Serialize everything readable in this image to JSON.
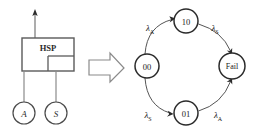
{
  "figure": {
    "left_diagram": {
      "block": {
        "label": "HSP",
        "x": 22,
        "y": 38,
        "width": 52,
        "height": 33,
        "inner_divider_x": 48,
        "inner_divider_y": 56
      },
      "output_arrow": {
        "name": "upward-output-arrow",
        "from_x": 35,
        "from_y": 38,
        "to_x": 35,
        "to_y": 12
      },
      "components": [
        {
          "label": "A",
          "cx": 24,
          "cy": 113,
          "r": 11,
          "stem_from_y": 71
        },
        {
          "label": "S",
          "cx": 56,
          "cy": 113,
          "r": 11,
          "stem_from_y": 71
        }
      ]
    },
    "transform_arrow": {
      "name": "block-arrow-right",
      "label": "",
      "x": 88,
      "y": 58,
      "width": 36,
      "height": 20
    },
    "markov_diagram": {
      "states": [
        {
          "id": "s00",
          "label": "00",
          "cx": 147,
          "cy": 66,
          "r": 12
        },
        {
          "id": "s10",
          "label": "10",
          "cx": 186,
          "cy": 21,
          "r": 12
        },
        {
          "id": "s01",
          "label": "01",
          "cx": 186,
          "cy": 113,
          "r": 12
        },
        {
          "id": "sfail",
          "label": "Fail",
          "cx": 232,
          "cy": 66,
          "r": 13
        }
      ],
      "transitions": [
        {
          "from": "s00",
          "to": "s10",
          "rate": "λ",
          "subscript": "A",
          "label_x": 151,
          "label_y": 28,
          "name": "transition-00-to-10"
        },
        {
          "from": "s10",
          "to": "sfail",
          "rate": "λ",
          "subscript": "S",
          "label_x": 215,
          "label_y": 28,
          "name": "transition-10-to-fail"
        },
        {
          "from": "s00",
          "to": "s01",
          "rate": "λ",
          "subscript": "S",
          "label_x": 148,
          "label_y": 115,
          "name": "transition-00-to-01"
        },
        {
          "from": "s01",
          "to": "sfail",
          "rate": "λ",
          "subscript": "A",
          "label_x": 218,
          "label_y": 115,
          "name": "transition-01-to-fail"
        }
      ]
    },
    "colors": {
      "stroke": "#3a3a3a",
      "thin_stroke": "#555555",
      "text": "#1a1a1a",
      "background": "#ffffff"
    }
  }
}
